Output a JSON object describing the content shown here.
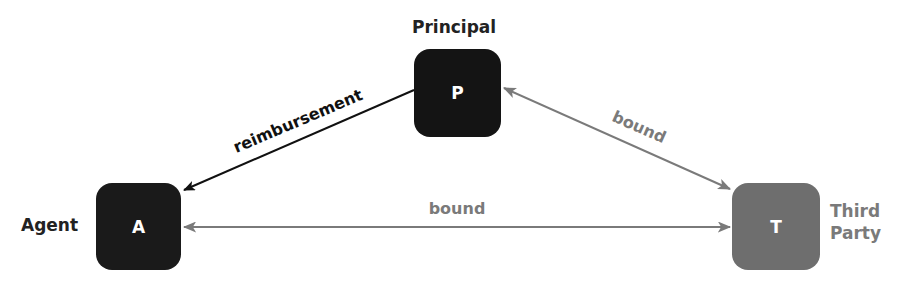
{
  "nodes": {
    "principal": {
      "letter": "P",
      "label": "Principal",
      "color": "#141414"
    },
    "agent": {
      "letter": "A",
      "label": "Agent",
      "color": "#1a1a1a"
    },
    "third_party": {
      "letter": "T",
      "label_line1": "Third",
      "label_line2": "Party",
      "color": "#6e6e6e"
    }
  },
  "edges": {
    "principal_agent": {
      "label": "reimbursement",
      "color": "#111111",
      "direction": "principal-to-agent"
    },
    "principal_third": {
      "label": "bound",
      "color": "#7a7a7a",
      "direction": "bidirectional"
    },
    "agent_third": {
      "label": "bound",
      "color": "#7a7a7a",
      "direction": "bidirectional"
    }
  }
}
